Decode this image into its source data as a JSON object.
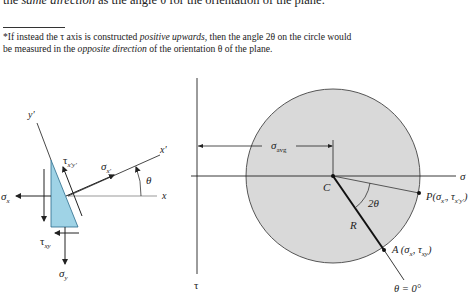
{
  "text": {
    "cut_line_prefix": "the ",
    "cut_line_italic": "same direction",
    "cut_line_suffix": " as the angle θ for the orientation of the plane.",
    "footnote": {
      "line1_a": "*If instead the τ axis is constructed ",
      "line1_italic": "positive upwards,",
      "line1_b": " then the angle 2θ on the circle would",
      "line2_a": "be measured in the ",
      "line2_italic": "opposite direction",
      "line2_b": " of the orientation θ of the plane."
    }
  },
  "element_diagram": {
    "labels": {
      "y_prime": "y′",
      "x_prime": "x′",
      "x": "x",
      "theta": "θ",
      "sigma": "σ",
      "sub_x": "x",
      "sub_x_prime": "x′",
      "sub_y": "y",
      "tau": "τ",
      "sub_xprime_yprime": "x′y′",
      "sub_xy": "xy"
    },
    "colors": {
      "wedge_fill": "#9fd3e6",
      "stroke": "#222222"
    }
  },
  "mohr_circle": {
    "labels": {
      "sigma_axis": "σ",
      "tau_axis": "τ",
      "sigma_avg": "σ",
      "sigma_avg_sub": "avg",
      "center": "C",
      "radius": "R",
      "two_theta": "2θ",
      "point_P": "P(σ",
      "point_P_sub1": "x′",
      "point_P_mid": ", τ",
      "point_P_sub2": "x′y′",
      "point_P_end": ")",
      "point_A": "A (σ",
      "point_A_sub1": "x",
      "point_A_mid": ", τ",
      "point_A_sub2": "xy",
      "point_A_end": ")",
      "theta_zero": "θ = 0°"
    },
    "colors": {
      "circle_fill": "#d9d9d9",
      "circle_stroke": "#444444"
    }
  }
}
